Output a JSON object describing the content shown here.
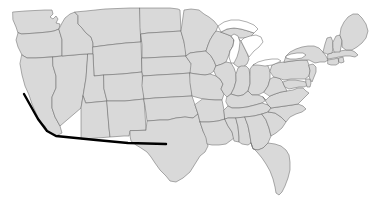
{
  "map": {
    "title": "Contiguous United States",
    "background_color": "#ffffff",
    "state_fill_color": "#d9d9d9",
    "state_border_color": "#6b6b6b",
    "lake_fill_color": "#ffffff",
    "route_color": "#000000",
    "route_width_px": 2.4,
    "projection_note": "Albers-like conic, lower 48 only",
    "width_px": 380,
    "height_px": 209
  },
  "route": {
    "name": "west-coast-to-texas-route",
    "stroke_color": "#000000",
    "description": "Line from Northern California south along the coast to Southern California, then east across Arizona and New Mexico into West Texas",
    "waypoints": [
      {
        "label": "Northern California",
        "x": 24,
        "y": 94
      },
      {
        "label": "Central California coast",
        "x": 38,
        "y": 119
      },
      {
        "label": "Southern California",
        "x": 47,
        "y": 131
      },
      {
        "label": "Southern California inland",
        "x": 56,
        "y": 136
      },
      {
        "label": "Arizona south",
        "x": 96,
        "y": 140
      },
      {
        "label": "New Mexico south",
        "x": 128,
        "y": 143
      },
      {
        "label": "West Texas",
        "x": 166,
        "y": 144
      }
    ]
  },
  "lakes": [
    {
      "name": "Lake Superior"
    },
    {
      "name": "Lake Michigan"
    },
    {
      "name": "Lake Huron"
    },
    {
      "name": "Lake Erie"
    },
    {
      "name": "Lake Ontario"
    }
  ],
  "states": [
    {
      "code": "WA",
      "name": "Washington"
    },
    {
      "code": "OR",
      "name": "Oregon"
    },
    {
      "code": "CA",
      "name": "California"
    },
    {
      "code": "NV",
      "name": "Nevada"
    },
    {
      "code": "ID",
      "name": "Idaho"
    },
    {
      "code": "MT",
      "name": "Montana"
    },
    {
      "code": "WY",
      "name": "Wyoming"
    },
    {
      "code": "UT",
      "name": "Utah"
    },
    {
      "code": "AZ",
      "name": "Arizona"
    },
    {
      "code": "CO",
      "name": "Colorado"
    },
    {
      "code": "NM",
      "name": "New Mexico"
    },
    {
      "code": "ND",
      "name": "North Dakota"
    },
    {
      "code": "SD",
      "name": "South Dakota"
    },
    {
      "code": "NE",
      "name": "Nebraska"
    },
    {
      "code": "KS",
      "name": "Kansas"
    },
    {
      "code": "OK",
      "name": "Oklahoma"
    },
    {
      "code": "TX",
      "name": "Texas"
    },
    {
      "code": "MN",
      "name": "Minnesota"
    },
    {
      "code": "IA",
      "name": "Iowa"
    },
    {
      "code": "MO",
      "name": "Missouri"
    },
    {
      "code": "AR",
      "name": "Arkansas"
    },
    {
      "code": "LA",
      "name": "Louisiana"
    },
    {
      "code": "WI",
      "name": "Wisconsin"
    },
    {
      "code": "IL",
      "name": "Illinois"
    },
    {
      "code": "MI",
      "name": "Michigan"
    },
    {
      "code": "IN",
      "name": "Indiana"
    },
    {
      "code": "OH",
      "name": "Ohio"
    },
    {
      "code": "KY",
      "name": "Kentucky"
    },
    {
      "code": "TN",
      "name": "Tennessee"
    },
    {
      "code": "MS",
      "name": "Mississippi"
    },
    {
      "code": "AL",
      "name": "Alabama"
    },
    {
      "code": "GA",
      "name": "Georgia"
    },
    {
      "code": "FL",
      "name": "Florida"
    },
    {
      "code": "SC",
      "name": "South Carolina"
    },
    {
      "code": "NC",
      "name": "North Carolina"
    },
    {
      "code": "VA",
      "name": "Virginia"
    },
    {
      "code": "WV",
      "name": "West Virginia"
    },
    {
      "code": "MD",
      "name": "Maryland"
    },
    {
      "code": "DE",
      "name": "Delaware"
    },
    {
      "code": "PA",
      "name": "Pennsylvania"
    },
    {
      "code": "NJ",
      "name": "New Jersey"
    },
    {
      "code": "NY",
      "name": "New York"
    },
    {
      "code": "CT",
      "name": "Connecticut"
    },
    {
      "code": "RI",
      "name": "Rhode Island"
    },
    {
      "code": "MA",
      "name": "Massachusetts"
    },
    {
      "code": "VT",
      "name": "Vermont"
    },
    {
      "code": "NH",
      "name": "New Hampshire"
    },
    {
      "code": "ME",
      "name": "Maine"
    }
  ]
}
